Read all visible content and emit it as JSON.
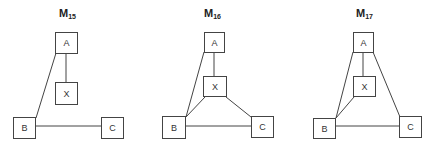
{
  "diagrams": [
    {
      "title_main": "M",
      "title_sub": "15",
      "nodes": {
        "A": "A",
        "X": "X",
        "B": "B",
        "C": "C"
      },
      "edges": [
        [
          "A",
          "X"
        ],
        [
          "A",
          "B"
        ],
        [
          "B",
          "C"
        ]
      ]
    },
    {
      "title_main": "M",
      "title_sub": "16",
      "nodes": {
        "A": "A",
        "X": "X",
        "B": "B",
        "C": "C"
      },
      "edges": [
        [
          "A",
          "X"
        ],
        [
          "A",
          "B"
        ],
        [
          "X",
          "B"
        ],
        [
          "X",
          "C"
        ],
        [
          "B",
          "C"
        ]
      ]
    },
    {
      "title_main": "M",
      "title_sub": "17",
      "nodes": {
        "A": "A",
        "X": "X",
        "B": "B",
        "C": "C"
      },
      "edges": [
        [
          "A",
          "X"
        ],
        [
          "A",
          "B"
        ],
        [
          "A",
          "C"
        ],
        [
          "X",
          "B"
        ],
        [
          "B",
          "C"
        ]
      ]
    }
  ],
  "colors": {
    "line": "#444444",
    "text": "#333333"
  }
}
